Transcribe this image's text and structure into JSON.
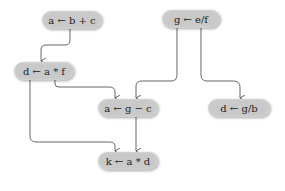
{
  "diagram": {
    "type": "dataflow-graph",
    "colors": {
      "node_fill": "#c9c9c9",
      "edge": "#555555",
      "background": "#ffffff"
    },
    "nodes": [
      {
        "id": "n1",
        "label": "a ← b + c",
        "x": 42,
        "y": 11,
        "w": 60
      },
      {
        "id": "n2",
        "label": "g ← e/f",
        "x": 162,
        "y": 10,
        "w": 58
      },
      {
        "id": "n3",
        "label": "d ← a * f",
        "x": 14,
        "y": 62,
        "w": 60
      },
      {
        "id": "n4",
        "label": "a ← g − c",
        "x": 98,
        "y": 99,
        "w": 60
      },
      {
        "id": "n5",
        "label": "d ← g/b",
        "x": 208,
        "y": 99,
        "w": 62
      },
      {
        "id": "n6",
        "label": "k ← a * d",
        "x": 98,
        "y": 152,
        "w": 60
      }
    ],
    "edges": [
      {
        "from": "a ← b + c",
        "to": "d ← a * f"
      },
      {
        "from": "d ← a * f",
        "to": "a ← g − c"
      },
      {
        "from": "d ← a * f",
        "to": "k ← a * d"
      },
      {
        "from": "g ← e/f",
        "to": "a ← g − c"
      },
      {
        "from": "g ← e/f",
        "to": "d ← g/b"
      },
      {
        "from": "a ← g − c",
        "to": "k ← a * d"
      }
    ]
  }
}
